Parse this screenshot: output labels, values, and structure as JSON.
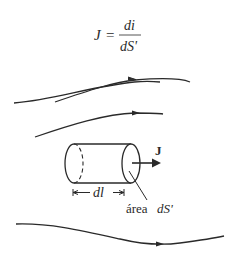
{
  "formula": {
    "lhs": "J",
    "equals": "=",
    "numerator": "di",
    "denominator": "dS'"
  },
  "labels": {
    "vector": "J",
    "length": "dl",
    "area_word": "área",
    "area_symbol": "dS'"
  },
  "colors": {
    "stroke": "#2a2a2a"
  }
}
